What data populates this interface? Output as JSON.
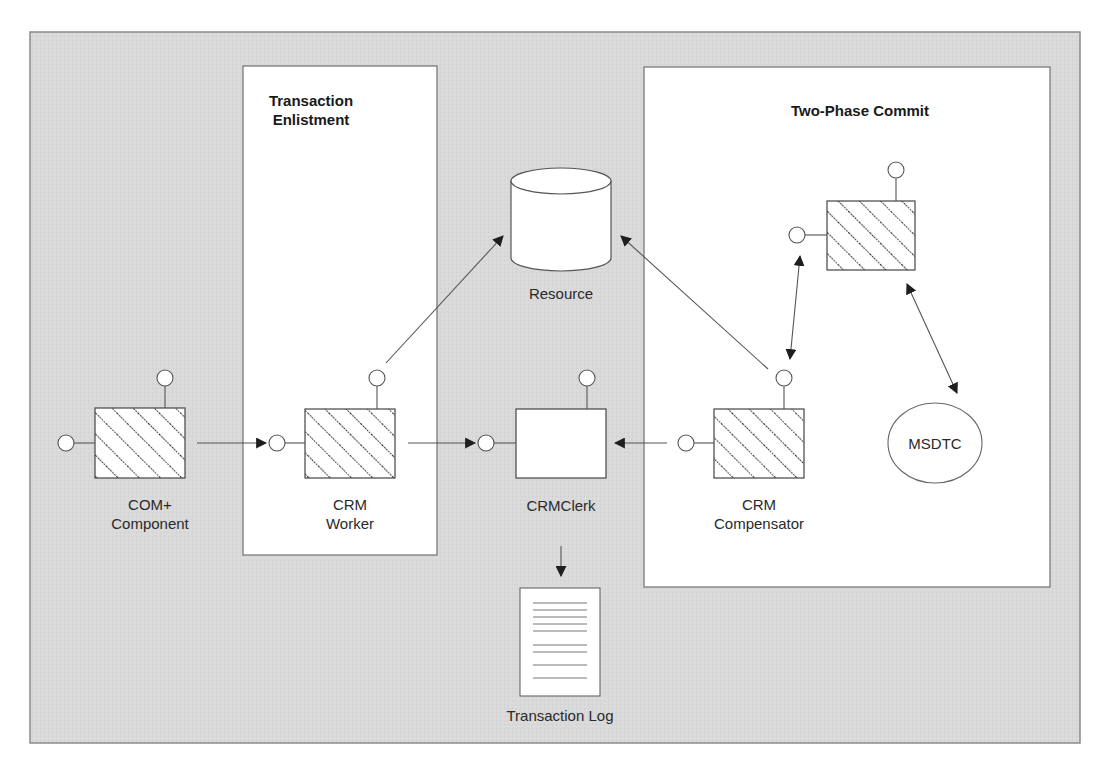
{
  "colors": {
    "panel_bg": "#d9d9d9",
    "panel_border": "#8a8a8a",
    "box_bg": "#ffffff",
    "line": "#555555",
    "arrow": "#1e1e1e",
    "hatch": "#2a2a2a"
  },
  "regions": {
    "enlistment": {
      "title": "Transaction\nEnlistment"
    },
    "two_phase": {
      "title": "Two-Phase Commit"
    }
  },
  "components": {
    "com_plus": {
      "label": "COM+\nComponent",
      "icon": "hatched-component-icon"
    },
    "crm_worker": {
      "label": "CRM\nWorker",
      "icon": "hatched-component-icon"
    },
    "crm_clerk": {
      "label": "CRMClerk",
      "icon": "plain-component-icon"
    },
    "crm_compensator": {
      "label": "CRM\nCompensator",
      "icon": "hatched-component-icon"
    },
    "dtc_component": {
      "label": "",
      "icon": "hatched-component-icon"
    },
    "resource": {
      "label": "Resource",
      "icon": "database-cylinder-icon"
    },
    "msdtc": {
      "label": "MSDTC",
      "icon": "ellipse-icon"
    },
    "transaction_log": {
      "label": "Transaction Log",
      "icon": "document-icon"
    }
  },
  "connections": [
    {
      "from": "COM+ Component",
      "to": "CRM Worker",
      "type": "one-way"
    },
    {
      "from": "CRM Worker",
      "to": "CRMClerk",
      "type": "one-way"
    },
    {
      "from": "CRM Compensator",
      "to": "CRMClerk",
      "type": "one-way"
    },
    {
      "from": "CRM Worker",
      "to": "Resource",
      "type": "one-way"
    },
    {
      "from": "CRM Compensator",
      "to": "Resource",
      "type": "one-way"
    },
    {
      "from": "CRM Compensator",
      "to": "DTC Component",
      "type": "two-way"
    },
    {
      "from": "DTC Component",
      "to": "MSDTC",
      "type": "two-way"
    },
    {
      "from": "CRMClerk",
      "to": "Transaction Log",
      "type": "one-way"
    }
  ]
}
